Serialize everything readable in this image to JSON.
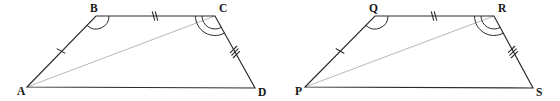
{
  "figure": {
    "background_color": "#ffffff",
    "stroke_color": "#2b2b2b",
    "diagonal_color": "#b0b0b0",
    "label_color": "#151515",
    "shapes": [
      {
        "name": "quadrilateral-abcd",
        "vertices": [
          {
            "id": "A",
            "label": "A",
            "x": 27,
            "y": 87,
            "label_x": 17,
            "label_y": 95
          },
          {
            "id": "B",
            "label": "B",
            "x": 96,
            "y": 16,
            "label_x": 90,
            "label_y": 12
          },
          {
            "id": "C",
            "label": "C",
            "x": 215,
            "y": 16,
            "label_x": 219,
            "label_y": 12
          },
          {
            "id": "D",
            "label": "D",
            "x": 255,
            "y": 88,
            "label_x": 258,
            "label_y": 96
          }
        ],
        "outline_path": "M27,87 L96,16 L215,16 L255,88 Z",
        "diagonal": {
          "name": "diagonal-a-c",
          "from": "A",
          "to": "C",
          "path": "M27,87 L215,16"
        },
        "side_marks": [
          {
            "name": "tick-side-ab",
            "side": "AB",
            "count": 1,
            "x": 61,
            "y": 51,
            "angle": -45.8
          },
          {
            "name": "tick-side-bc",
            "side": "BC",
            "count": 2,
            "x": 155,
            "y": 16,
            "angle": 0
          },
          {
            "name": "tick-side-cd",
            "side": "CD",
            "count": 3,
            "x": 235,
            "y": 52,
            "angle": 60.9
          }
        ],
        "angle_marks": [
          {
            "name": "angle-arc-b",
            "vertex": "B",
            "count": 1,
            "cx": 96,
            "cy": 16,
            "start_deg": 0,
            "end_deg": 134
          },
          {
            "name": "angle-arc-c",
            "vertex": "C",
            "count": 2,
            "cx": 215,
            "cy": 16,
            "start_deg": 180,
            "end_deg": 61
          }
        ]
      },
      {
        "name": "quadrilateral-pqrs",
        "vertices": [
          {
            "id": "P",
            "label": "P",
            "x": 305,
            "y": 87,
            "label_x": 295,
            "label_y": 95
          },
          {
            "id": "Q",
            "label": "Q",
            "x": 375,
            "y": 16,
            "label_x": 369,
            "label_y": 12
          },
          {
            "id": "R",
            "label": "R",
            "x": 494,
            "y": 16,
            "label_x": 498,
            "label_y": 12
          },
          {
            "id": "S",
            "label": "S",
            "x": 533,
            "y": 88,
            "label_x": 536,
            "label_y": 96
          }
        ],
        "outline_path": "M305,87 L375,16 L494,16 L533,88 Z",
        "diagonal": {
          "name": "diagonal-p-r",
          "from": "P",
          "to": "R",
          "path": "M305,87 L494,16"
        },
        "side_marks": [
          {
            "name": "tick-side-pq",
            "side": "PQ",
            "count": 1,
            "x": 340,
            "y": 51,
            "angle": -45.4
          },
          {
            "name": "tick-side-qr",
            "side": "QR",
            "count": 2,
            "x": 434,
            "y": 16,
            "angle": 0
          },
          {
            "name": "tick-side-rs",
            "side": "RS",
            "count": 3,
            "x": 513,
            "y": 52,
            "angle": 61.5
          }
        ],
        "angle_marks": [
          {
            "name": "angle-arc-q",
            "vertex": "Q",
            "count": 1,
            "cx": 375,
            "cy": 16,
            "start_deg": 0,
            "end_deg": 134
          },
          {
            "name": "angle-arc-r",
            "vertex": "R",
            "count": 2,
            "cx": 494,
            "cy": 16,
            "start_deg": 180,
            "end_deg": 61
          }
        ]
      }
    ]
  }
}
